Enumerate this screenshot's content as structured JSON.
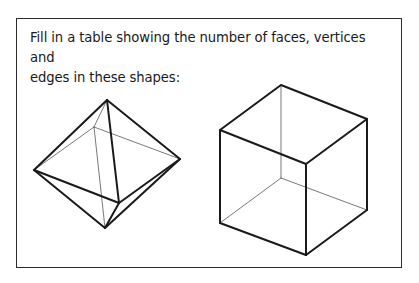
{
  "prompt": {
    "line1": "Fill in a table showing the number of faces, vertices and",
    "line2": "edges in these shapes:"
  },
  "shapes": [
    {
      "name": "octahedron"
    },
    {
      "name": "cube"
    }
  ],
  "colors": {
    "stroke": "#1a1a1a",
    "hidden_stroke": "#555555",
    "frame": "#2a2a2a"
  }
}
